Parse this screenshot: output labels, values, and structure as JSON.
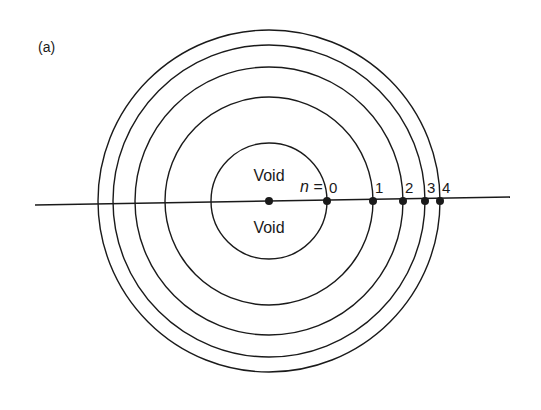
{
  "figure": {
    "panel_label": "(a)",
    "center": {
      "x": 269,
      "y": 201
    },
    "axis_line": {
      "x1": 35,
      "y1": 205,
      "x2": 510,
      "y2": 197
    },
    "inner_label_top": "Void",
    "inner_label_bottom": "Void",
    "index_prefix": "n =",
    "shells": [
      {
        "n": "0",
        "radius": 58
      },
      {
        "n": "1",
        "radius": 104
      },
      {
        "n": "2",
        "radius": 134
      },
      {
        "n": "3",
        "radius": 156
      },
      {
        "n": "4",
        "radius": 171
      }
    ],
    "line_color": "#1a1a1a",
    "background": "#ffffff"
  }
}
